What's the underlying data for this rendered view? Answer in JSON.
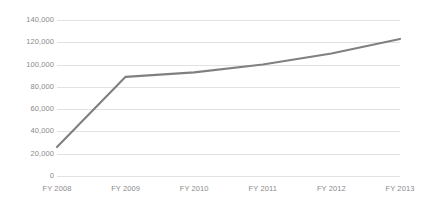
{
  "chart_data": {
    "type": "line",
    "title": "",
    "subtitle": "",
    "xlabel": "",
    "ylabel": "",
    "categories": [
      "FY 2008",
      "FY 2009",
      "FY 2010",
      "FY 2011",
      "FY 2012",
      "FY 2013"
    ],
    "series": [
      {
        "name": "Series 1",
        "values": [
          26000,
          89000,
          93000,
          100000,
          110000,
          123000
        ],
        "color": "#808080"
      }
    ],
    "ylim": [
      0,
      140000
    ],
    "ytick_values": [
      0,
      20000,
      40000,
      60000,
      80000,
      100000,
      120000,
      140000
    ],
    "ytick_labels": [
      "0",
      "20,000",
      "40,000",
      "60,000",
      "80,000",
      "100,000",
      "120,000",
      "140,000"
    ],
    "grid": true,
    "grid_axis": "y",
    "grid_color": "#e2e2e2",
    "legend": false,
    "legend_position": "none",
    "background_color": "#ffffff",
    "axis_label_color": "#8a8a8a"
  }
}
